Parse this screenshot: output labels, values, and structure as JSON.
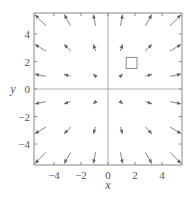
{
  "chart_data": {
    "type": "vector_field",
    "title": "",
    "xlabel": "x",
    "ylabel": "y",
    "xlim": [
      -5.5,
      5.5
    ],
    "ylim": [
      -5.6,
      5.6
    ],
    "xticks": [
      -4,
      -2,
      0,
      2,
      4
    ],
    "yticks": [
      -4,
      -2,
      0,
      2,
      4
    ],
    "xtick_labels": [
      "−4",
      "−2",
      "0",
      "2",
      "4"
    ],
    "ytick_labels": [
      "4",
      "2",
      "0",
      "−2",
      "−4"
    ],
    "grid": false,
    "axes_through_origin": true,
    "field": "radial outward F(x,y) = k(x, y)",
    "sample_x": [
      -5,
      -3,
      -1,
      1,
      3,
      5
    ],
    "sample_y": [
      -5,
      -3,
      -1,
      1,
      3,
      5
    ],
    "arrow_scale": 0.16,
    "annotation": {
      "shape": "square",
      "center": [
        1.75,
        1.9
      ],
      "size": 0.8
    },
    "colors": {
      "arrow": "#777777",
      "frame": "#888888",
      "axis": "#999999",
      "square": "#888888"
    }
  },
  "labels": {
    "x_axis": "x",
    "y_axis": "y"
  }
}
